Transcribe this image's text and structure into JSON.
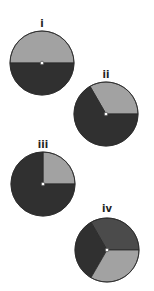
{
  "figure": {
    "colors": {
      "light": "#a2a2a2",
      "medium": "#4b4b4b",
      "dark": "#303030",
      "outline": "#2a2a2a"
    },
    "pies": [
      {
        "label": "i",
        "cx": 42,
        "cy": 63,
        "r": 32,
        "slices": [
          {
            "from": 0,
            "to": 180,
            "shade": "light"
          },
          {
            "from": 180,
            "to": 360,
            "shade": "dark"
          }
        ]
      },
      {
        "label": "ii",
        "cx": 106,
        "cy": 114,
        "r": 32,
        "slices": [
          {
            "from": 0,
            "to": 120,
            "shade": "light"
          },
          {
            "from": 120,
            "to": 360,
            "shade": "dark"
          }
        ]
      },
      {
        "label": "iii",
        "cx": 43,
        "cy": 184,
        "r": 32,
        "slices": [
          {
            "from": 0,
            "to": 90,
            "shade": "light"
          },
          {
            "from": 90,
            "to": 360,
            "shade": "dark"
          }
        ]
      },
      {
        "label": "iv",
        "cx": 107,
        "cy": 250,
        "r": 32,
        "slices": [
          {
            "from": 0,
            "to": 120,
            "shade": "medium"
          },
          {
            "from": 120,
            "to": 240,
            "shade": "dark"
          },
          {
            "from": 240,
            "to": 360,
            "shade": "light"
          }
        ]
      }
    ]
  }
}
